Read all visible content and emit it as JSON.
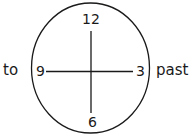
{
  "diagram": {
    "type": "clock-face",
    "numbers": {
      "top": "12",
      "right": "3",
      "bottom": "6",
      "left": "9"
    },
    "side_labels": {
      "left": "to",
      "right": "past"
    },
    "colors": {
      "stroke": "#1a1a1a",
      "background": "#ffffff"
    }
  }
}
